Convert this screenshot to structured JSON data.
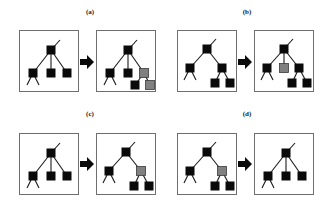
{
  "figure": {
    "subfigures": [
      {
        "id": "a",
        "label": "(a)",
        "label_pos": [
          75,
          8
        ],
        "arrow_pos": [
          80,
          55
        ],
        "before": {
          "pos": [
            19,
            30
          ],
          "nodes": [
            {
              "id": "r",
              "x": 31,
              "y": 19,
              "fill": "black"
            },
            {
              "id": "l",
              "x": 13,
              "y": 42,
              "fill": "black"
            },
            {
              "id": "m",
              "x": 31,
              "y": 42,
              "fill": "black"
            },
            {
              "id": "rr",
              "x": 47,
              "y": 42,
              "fill": "black"
            }
          ],
          "edges": [
            [
              "r",
              "l"
            ],
            [
              "r",
              "m"
            ],
            [
              "r",
              "rr"
            ]
          ],
          "stubs": [
            {
              "from": "r",
              "to": [
                40,
                9
              ]
            },
            {
              "from": "l",
              "to": [
                7,
                54
              ]
            },
            {
              "from": "l",
              "to": [
                19,
                54
              ]
            }
          ]
        },
        "after": {
          "pos": [
            96,
            30
          ],
          "nodes": [
            {
              "id": "r",
              "x": 31,
              "y": 19,
              "fill": "black"
            },
            {
              "id": "l",
              "x": 13,
              "y": 42,
              "fill": "black"
            },
            {
              "id": "m",
              "x": 31,
              "y": 42,
              "fill": "black"
            },
            {
              "id": "rr",
              "x": 47,
              "y": 42,
              "fill": "gray"
            },
            {
              "id": "c1",
              "x": 38,
              "y": 54,
              "fill": "black"
            },
            {
              "id": "c2",
              "x": 53,
              "y": 54,
              "fill": "gray"
            }
          ],
          "edges": [
            [
              "r",
              "l"
            ],
            [
              "r",
              "m"
            ],
            [
              "r",
              "rr"
            ],
            [
              "rr",
              "c1"
            ],
            [
              "rr",
              "c2"
            ]
          ],
          "stubs": [
            {
              "from": "r",
              "to": [
                40,
                9
              ]
            },
            {
              "from": "l",
              "to": [
                7,
                54
              ]
            },
            {
              "from": "l",
              "to": [
                19,
                54
              ]
            }
          ]
        }
      },
      {
        "id": "b",
        "label": "(b)",
        "label_pos": [
          232,
          8
        ],
        "arrow_pos": [
          238,
          55
        ],
        "before": {
          "pos": [
            177,
            30
          ],
          "nodes": [
            {
              "id": "r",
              "x": 29,
              "y": 18,
              "fill": "black"
            },
            {
              "id": "l",
              "x": 12,
              "y": 37,
              "fill": "black"
            },
            {
              "id": "rr",
              "x": 44,
              "y": 37,
              "fill": "black"
            },
            {
              "id": "c1",
              "x": 37,
              "y": 52,
              "fill": "black"
            },
            {
              "id": "c2",
              "x": 52,
              "y": 52,
              "fill": "black"
            }
          ],
          "edges": [
            [
              "r",
              "l"
            ],
            [
              "r",
              "rr"
            ],
            [
              "rr",
              "c1"
            ],
            [
              "rr",
              "c2"
            ]
          ],
          "stubs": [
            {
              "from": "r",
              "to": [
                38,
                8
              ]
            },
            {
              "from": "l",
              "to": [
                6,
                49
              ]
            },
            {
              "from": "l",
              "to": [
                18,
                49
              ]
            }
          ]
        },
        "after": {
          "pos": [
            254,
            30
          ],
          "nodes": [
            {
              "id": "r",
              "x": 29,
              "y": 18,
              "fill": "black"
            },
            {
              "id": "l",
              "x": 12,
              "y": 37,
              "fill": "black"
            },
            {
              "id": "m",
              "x": 29,
              "y": 37,
              "fill": "gray"
            },
            {
              "id": "rr",
              "x": 44,
              "y": 37,
              "fill": "black"
            },
            {
              "id": "c1",
              "x": 37,
              "y": 52,
              "fill": "black"
            },
            {
              "id": "c2",
              "x": 52,
              "y": 52,
              "fill": "black"
            }
          ],
          "edges": [
            [
              "r",
              "l"
            ],
            [
              "r",
              "m"
            ],
            [
              "r",
              "rr"
            ],
            [
              "rr",
              "c1"
            ],
            [
              "rr",
              "c2"
            ]
          ],
          "stubs": [
            {
              "from": "r",
              "to": [
                38,
                8
              ]
            },
            {
              "from": "l",
              "to": [
                6,
                49
              ]
            },
            {
              "from": "l",
              "to": [
                18,
                49
              ]
            }
          ]
        }
      },
      {
        "id": "c",
        "label": "(c)",
        "label_pos": [
          75,
          110
        ],
        "arrow_pos": [
          80,
          157
        ],
        "before": {
          "pos": [
            19,
            133
          ],
          "nodes": [
            {
              "id": "r",
              "x": 31,
              "y": 19,
              "fill": "black"
            },
            {
              "id": "l",
              "x": 13,
              "y": 42,
              "fill": "black"
            },
            {
              "id": "m",
              "x": 31,
              "y": 42,
              "fill": "black"
            },
            {
              "id": "rr",
              "x": 47,
              "y": 42,
              "fill": "black"
            }
          ],
          "edges": [
            [
              "r",
              "l"
            ],
            [
              "r",
              "m"
            ],
            [
              "r",
              "rr"
            ]
          ],
          "stubs": [
            {
              "from": "r",
              "to": [
                40,
                9
              ]
            },
            {
              "from": "l",
              "to": [
                7,
                54
              ]
            },
            {
              "from": "l",
              "to": [
                19,
                54
              ]
            }
          ]
        },
        "after": {
          "pos": [
            96,
            133
          ],
          "nodes": [
            {
              "id": "r",
              "x": 29,
              "y": 18,
              "fill": "black"
            },
            {
              "id": "l",
              "x": 12,
              "y": 37,
              "fill": "black"
            },
            {
              "id": "rr",
              "x": 44,
              "y": 37,
              "fill": "gray"
            },
            {
              "id": "c1",
              "x": 37,
              "y": 52,
              "fill": "black"
            },
            {
              "id": "c2",
              "x": 52,
              "y": 52,
              "fill": "black"
            }
          ],
          "edges": [
            [
              "r",
              "l"
            ],
            [
              "r",
              "rr"
            ],
            [
              "rr",
              "c1"
            ],
            [
              "rr",
              "c2"
            ]
          ],
          "stubs": [
            {
              "from": "r",
              "to": [
                38,
                8
              ]
            },
            {
              "from": "l",
              "to": [
                6,
                49
              ]
            },
            {
              "from": "l",
              "to": [
                18,
                49
              ]
            }
          ]
        }
      },
      {
        "id": "d",
        "label": "(d)",
        "label_pos": [
          232,
          110
        ],
        "arrow_pos": [
          238,
          157
        ],
        "before": {
          "pos": [
            177,
            133
          ],
          "nodes": [
            {
              "id": "r",
              "x": 29,
              "y": 18,
              "fill": "black"
            },
            {
              "id": "l",
              "x": 12,
              "y": 37,
              "fill": "black"
            },
            {
              "id": "rr",
              "x": 44,
              "y": 37,
              "fill": "gray"
            },
            {
              "id": "c1",
              "x": 37,
              "y": 52,
              "fill": "black"
            },
            {
              "id": "c2",
              "x": 52,
              "y": 52,
              "fill": "black"
            }
          ],
          "edges": [
            [
              "r",
              "l"
            ],
            [
              "r",
              "rr"
            ],
            [
              "rr",
              "c1"
            ],
            [
              "rr",
              "c2"
            ]
          ],
          "stubs": [
            {
              "from": "r",
              "to": [
                38,
                8
              ]
            },
            {
              "from": "l",
              "to": [
                6,
                49
              ]
            },
            {
              "from": "l",
              "to": [
                18,
                49
              ]
            }
          ]
        },
        "after": {
          "pos": [
            254,
            133
          ],
          "nodes": [
            {
              "id": "r",
              "x": 31,
              "y": 19,
              "fill": "black"
            },
            {
              "id": "l",
              "x": 13,
              "y": 42,
              "fill": "black"
            },
            {
              "id": "m",
              "x": 31,
              "y": 42,
              "fill": "black"
            },
            {
              "id": "rr",
              "x": 47,
              "y": 42,
              "fill": "black"
            }
          ],
          "edges": [
            [
              "r",
              "l"
            ],
            [
              "r",
              "m"
            ],
            [
              "r",
              "rr"
            ]
          ],
          "stubs": [
            {
              "from": "r",
              "to": [
                40,
                9
              ]
            },
            {
              "from": "l",
              "to": [
                7,
                54
              ]
            },
            {
              "from": "l",
              "to": [
                19,
                54
              ]
            }
          ]
        }
      }
    ],
    "colors": {
      "black": "#0a0a0a",
      "gray": "#808080",
      "gray_border": "#3a3a3a",
      "edge": "#1a1a1a",
      "frame": "#6e6e6e"
    },
    "node_size": 9
  }
}
